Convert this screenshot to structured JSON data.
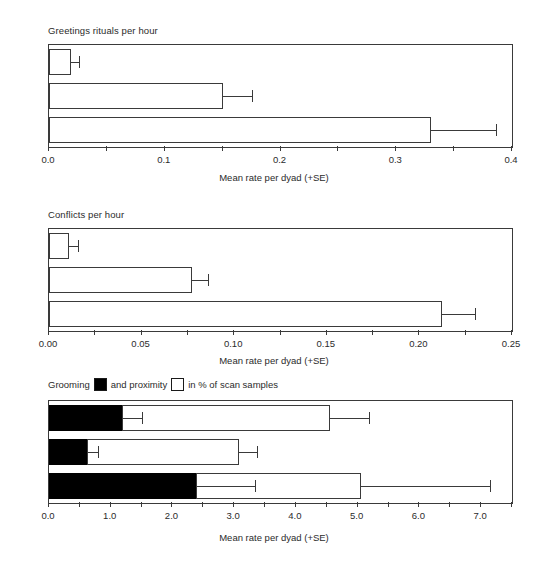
{
  "figure": {
    "background": "#ffffff",
    "line_color": "#3a3a3a",
    "fill_black": "#000000",
    "fill_white": "#ffffff",
    "shared_xlabel": "Mean rate per dyad (+SE)",
    "categories": [
      "FF",
      "MF",
      "MM"
    ]
  },
  "legend": {
    "prefix": "Grooming",
    "middle": "and proximity",
    "suffix": "in % of scan samples",
    "black_swatch": "black-square-swatch",
    "white_swatch": "white-square-swatch"
  },
  "chart_data": [
    {
      "type": "bar",
      "title": "Greetings rituals per hour",
      "orientation": "horizontal",
      "categories": [
        "FF",
        "MF",
        "MM"
      ],
      "values": [
        0.019,
        0.15,
        0.33
      ],
      "errors_upper": [
        0.026,
        0.175,
        0.386
      ],
      "xlabel": "Mean rate per dyad (+SE)",
      "ylabel": "",
      "xlim": [
        0.0,
        0.4
      ],
      "xticks": [
        0.0,
        0.1,
        0.2,
        0.3,
        0.4
      ],
      "xticklabels": [
        "0.0",
        "0.1",
        "0.2",
        "0.3",
        "0.4"
      ],
      "minor_tick_step": 0.05,
      "grid": false,
      "legend": false
    },
    {
      "type": "bar",
      "title": "Conflicts per hour",
      "orientation": "horizontal",
      "categories": [
        "FF",
        "MF",
        "MM"
      ],
      "values": [
        0.011,
        0.077,
        0.212
      ],
      "errors_upper": [
        0.0155,
        0.086,
        0.23
      ],
      "xlabel": "Mean rate per dyad (+SE)",
      "ylabel": "",
      "xlim": [
        0.0,
        0.25
      ],
      "xticks": [
        0.0,
        0.05,
        0.1,
        0.15,
        0.2,
        0.25
      ],
      "xticklabels": [
        "0.00",
        "0.05",
        "0.10",
        "0.15",
        "0.20",
        "0.25"
      ],
      "minor_tick_step": 0.025,
      "grid": false,
      "legend": false
    },
    {
      "type": "bar",
      "title": "Grooming and proximity in % of scan samples",
      "orientation": "horizontal",
      "stacked": true,
      "categories": [
        "FF",
        "MF",
        "MM"
      ],
      "series": [
        {
          "name": "Grooming",
          "fill": "black",
          "values": [
            1.18,
            0.62,
            2.38
          ],
          "errors_upper": [
            1.5,
            0.8,
            3.33
          ]
        },
        {
          "name": "Proximity",
          "fill": "white",
          "values": [
            3.37,
            2.45,
            2.67
          ],
          "cumulative_values": [
            4.55,
            3.07,
            5.05
          ],
          "errors_upper": [
            5.18,
            3.37,
            7.15
          ]
        }
      ],
      "xlabel": "Mean rate per dyad (+SE)",
      "ylabel": "",
      "xlim": [
        0.0,
        7.5
      ],
      "xticks": [
        0.0,
        1.0,
        2.0,
        3.0,
        4.0,
        5.0,
        6.0,
        7.0
      ],
      "xticklabels": [
        "0.0",
        "1.0",
        "2.0",
        "3.0",
        "4.0",
        "5.0",
        "6.0",
        "7.0"
      ],
      "minor_tick_step": 0.5,
      "grid": false,
      "legend": true
    }
  ]
}
